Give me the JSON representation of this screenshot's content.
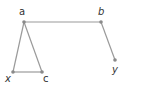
{
  "diagram": {
    "type": "graph",
    "nodes": [
      {
        "id": "a",
        "label": "a",
        "x": 24,
        "y": 22,
        "lx": 19,
        "ly": 15,
        "italic": false
      },
      {
        "id": "b",
        "label": "b",
        "x": 101,
        "y": 22,
        "lx": 98,
        "ly": 15,
        "italic": true
      },
      {
        "id": "x",
        "label": "x",
        "x": 13,
        "y": 72,
        "lx": 5,
        "ly": 82,
        "italic": true
      },
      {
        "id": "c",
        "label": "c",
        "x": 42,
        "y": 72,
        "lx": 43,
        "ly": 82,
        "italic": false
      },
      {
        "id": "y",
        "label": "y",
        "x": 115,
        "y": 60,
        "lx": 112,
        "ly": 73,
        "italic": true
      }
    ],
    "edges": [
      {
        "from": "a",
        "to": "b"
      },
      {
        "from": "a",
        "to": "x"
      },
      {
        "from": "a",
        "to": "c"
      },
      {
        "from": "x",
        "to": "c"
      },
      {
        "from": "b",
        "to": "y"
      }
    ],
    "colors": {
      "edge": "#9a9a9a",
      "node": "#8a8a8a",
      "label": "#333333"
    }
  }
}
